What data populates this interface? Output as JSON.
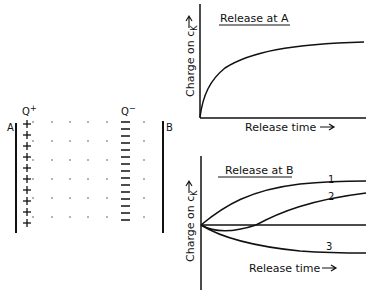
{
  "diagram": {
    "plate_a_label": "A",
    "plate_b_label": "B",
    "charge_plus_label": "Q",
    "charge_plus_sup": "+",
    "charge_minus_label": "Q",
    "charge_minus_sup": "−",
    "plus_sign": "+",
    "plus_count": 10,
    "minus_count": 15
  },
  "chart_data": [
    {
      "type": "line",
      "title": "Release at A",
      "xlabel": "Release time →",
      "ylabel": "Charge on c_K →",
      "grid": false,
      "series": [
        {
          "name": "charge",
          "x": [
            0,
            0.1,
            0.2,
            0.3,
            0.5,
            0.7,
            1.0
          ],
          "values": [
            0,
            0.45,
            0.62,
            0.72,
            0.85,
            0.92,
            0.95
          ]
        }
      ]
    },
    {
      "type": "line",
      "title": "Release at B",
      "xlabel": "Release time →",
      "ylabel": "Charge on c_K →",
      "grid": false,
      "series": [
        {
          "name": "1",
          "x": [
            0,
            0.2,
            0.4,
            0.6,
            1.0
          ],
          "values": [
            0,
            0.5,
            0.7,
            0.8,
            0.85
          ]
        },
        {
          "name": "2",
          "x": [
            0,
            0.15,
            0.35,
            0.6,
            1.0
          ],
          "values": [
            0,
            -0.12,
            0.0,
            0.4,
            0.65
          ]
        },
        {
          "name": "3",
          "x": [
            0,
            0.2,
            0.4,
            0.7,
            1.0
          ],
          "values": [
            0,
            -0.3,
            -0.5,
            -0.58,
            -0.6
          ]
        }
      ]
    }
  ],
  "charts": {
    "top": {
      "title": "Release at A",
      "xlabel": "Release time",
      "ylabel": "Charge on c",
      "ylabel_sub": "K"
    },
    "bottom": {
      "title": "Release at B",
      "xlabel": "Release time",
      "ylabel": "Charge on c",
      "ylabel_sub": "K",
      "curve_labels": [
        "1",
        "2",
        "3"
      ]
    }
  }
}
